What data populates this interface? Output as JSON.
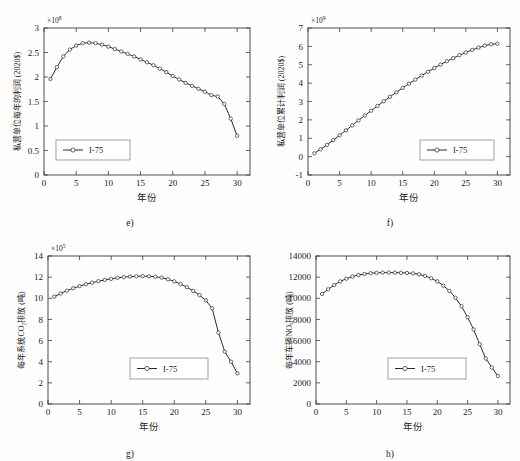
{
  "figure": {
    "background": "#fefefe",
    "series_color": "#2b2b2b",
    "axis_color": "#3a3a3a"
  },
  "panels": [
    {
      "id": "e",
      "caption": "e)",
      "legend_label": "I-75",
      "exponent": "×10",
      "exponent_sup": "8",
      "ylabel": "私营单位每年的利润 (2020$)",
      "xlabel": "年份",
      "yticks": [
        "0",
        "0.5",
        "1",
        "1.5",
        "2",
        "2.5",
        "3"
      ],
      "xticks": [
        "0",
        "5",
        "10",
        "15",
        "20",
        "25",
        "30"
      ]
    },
    {
      "id": "f",
      "caption": "f)",
      "legend_label": "I-75",
      "exponent": "×10",
      "exponent_sup": "9",
      "ylabel": "私营单位累计利润 (2020$)",
      "xlabel": "年份",
      "yticks": [
        "-1",
        "0",
        "1",
        "2",
        "3",
        "4",
        "5",
        "6",
        "7"
      ],
      "xticks": [
        "0",
        "5",
        "10",
        "15",
        "20",
        "25",
        "30"
      ]
    },
    {
      "id": "g",
      "caption": "g)",
      "legend_label": "I-75",
      "exponent": "×10",
      "exponent_sup": "5",
      "ylabel": "每年系统CO₂排放 (吨)",
      "xlabel": "年份",
      "yticks": [
        "0",
        "2",
        "4",
        "6",
        "8",
        "10",
        "12",
        "14"
      ],
      "xticks": [
        "0",
        "5",
        "10",
        "15",
        "20",
        "25",
        "30"
      ]
    },
    {
      "id": "h",
      "caption": "h)",
      "legend_label": "I-75",
      "exponent": "",
      "exponent_sup": "",
      "ylabel": "每年车辆NOₓ排放 (吨)",
      "xlabel": "年份",
      "yticks": [
        "0",
        "2000",
        "4000",
        "6000",
        "8000",
        "10000",
        "12000",
        "14000"
      ],
      "xticks": [
        "0",
        "5",
        "10",
        "15",
        "20",
        "25",
        "30"
      ]
    }
  ],
  "chart_data": [
    {
      "type": "line",
      "panel": "e",
      "title": "e)",
      "xlabel": "年份",
      "ylabel": "私营单位每年的利润 (2020$)",
      "y_exponent": 100000000.0,
      "xlim": [
        0,
        32
      ],
      "ylim": [
        0,
        3
      ],
      "xticks": [
        0,
        5,
        10,
        15,
        20,
        25,
        30
      ],
      "yticks": [
        0,
        0.5,
        1,
        1.5,
        2,
        2.5,
        3
      ],
      "grid": false,
      "legend": [
        "I-75"
      ],
      "legend_position": "lower-left",
      "x": [
        1,
        2,
        3,
        4,
        5,
        6,
        7,
        8,
        9,
        10,
        11,
        12,
        13,
        14,
        15,
        16,
        17,
        18,
        19,
        20,
        21,
        22,
        23,
        24,
        25,
        26,
        27,
        28,
        29,
        30
      ],
      "series": [
        {
          "name": "I-75",
          "values": [
            1.96,
            2.2,
            2.42,
            2.56,
            2.64,
            2.69,
            2.7,
            2.69,
            2.66,
            2.62,
            2.57,
            2.52,
            2.47,
            2.42,
            2.36,
            2.3,
            2.24,
            2.17,
            2.1,
            2.02,
            1.95,
            1.88,
            1.82,
            1.76,
            1.7,
            1.63,
            1.6,
            1.45,
            1.15,
            0.8,
            0.48
          ]
        }
      ]
    },
    {
      "type": "line",
      "panel": "f",
      "title": "f)",
      "xlabel": "年份",
      "ylabel": "私营单位累计利润 (2020$)",
      "y_exponent": 1000000000.0,
      "xlim": [
        0,
        32
      ],
      "ylim": [
        -1,
        7
      ],
      "xticks": [
        0,
        5,
        10,
        15,
        20,
        25,
        30
      ],
      "yticks": [
        -1,
        0,
        1,
        2,
        3,
        4,
        5,
        6,
        7
      ],
      "grid": false,
      "legend": [
        "I-75"
      ],
      "legend_position": "lower-right",
      "x": [
        1,
        2,
        3,
        4,
        5,
        6,
        7,
        8,
        9,
        10,
        11,
        12,
        13,
        14,
        15,
        16,
        17,
        18,
        19,
        20,
        21,
        22,
        23,
        24,
        25,
        26,
        27,
        28,
        29,
        30
      ],
      "series": [
        {
          "name": "I-75",
          "values": [
            0.18,
            0.4,
            0.64,
            0.9,
            1.16,
            1.43,
            1.7,
            1.97,
            2.24,
            2.5,
            2.76,
            3.01,
            3.26,
            3.5,
            3.74,
            3.97,
            4.19,
            4.41,
            4.62,
            4.82,
            5.01,
            5.19,
            5.36,
            5.52,
            5.67,
            5.81,
            5.93,
            6.04,
            6.11,
            6.15
          ]
        }
      ]
    },
    {
      "type": "line",
      "panel": "g",
      "title": "g)",
      "xlabel": "年份",
      "ylabel": "每年系统CO₂排放 (吨)",
      "y_exponent": 100000.0,
      "xlim": [
        0,
        32
      ],
      "ylim": [
        0,
        14
      ],
      "xticks": [
        0,
        5,
        10,
        15,
        20,
        25,
        30
      ],
      "yticks": [
        0,
        2,
        4,
        6,
        8,
        10,
        12,
        14
      ],
      "grid": false,
      "legend": [
        "I-75"
      ],
      "legend_position": "lower-center",
      "x": [
        1,
        2,
        3,
        4,
        5,
        6,
        7,
        8,
        9,
        10,
        11,
        12,
        13,
        14,
        15,
        16,
        17,
        18,
        19,
        20,
        21,
        22,
        23,
        24,
        25,
        26,
        27,
        28,
        29,
        30
      ],
      "series": [
        {
          "name": "I-75",
          "values": [
            10.15,
            10.45,
            10.72,
            10.95,
            11.15,
            11.33,
            11.48,
            11.62,
            11.74,
            11.84,
            11.93,
            12.0,
            12.05,
            12.08,
            12.09,
            12.08,
            12.04,
            11.95,
            11.8,
            11.6,
            11.35,
            11.05,
            10.7,
            10.3,
            9.8,
            9.05,
            6.75,
            4.95,
            4.0,
            2.9,
            1.98
          ]
        }
      ]
    },
    {
      "type": "line",
      "panel": "h",
      "title": "h)",
      "xlabel": "年份",
      "ylabel": "每年车辆NOₓ排放 (吨)",
      "y_exponent": 1,
      "xlim": [
        0,
        32
      ],
      "ylim": [
        0,
        14000
      ],
      "xticks": [
        0,
        5,
        10,
        15,
        20,
        25,
        30
      ],
      "yticks": [
        0,
        2000,
        4000,
        6000,
        8000,
        10000,
        12000,
        14000
      ],
      "grid": false,
      "legend": [
        "I-75"
      ],
      "legend_position": "lower-center",
      "x": [
        1,
        2,
        3,
        4,
        5,
        6,
        7,
        8,
        9,
        10,
        11,
        12,
        13,
        14,
        15,
        16,
        17,
        18,
        19,
        20,
        21,
        22,
        23,
        24,
        25,
        26,
        27,
        28,
        29,
        30
      ],
      "series": [
        {
          "name": "I-75",
          "values": [
            10400,
            10850,
            11250,
            11600,
            11850,
            12050,
            12200,
            12300,
            12370,
            12410,
            12430,
            12440,
            12430,
            12410,
            12390,
            12350,
            12270,
            12120,
            11900,
            11600,
            11200,
            10700,
            10050,
            9250,
            8200,
            7050,
            5650,
            4300,
            3450,
            2650
          ]
        }
      ]
    }
  ]
}
